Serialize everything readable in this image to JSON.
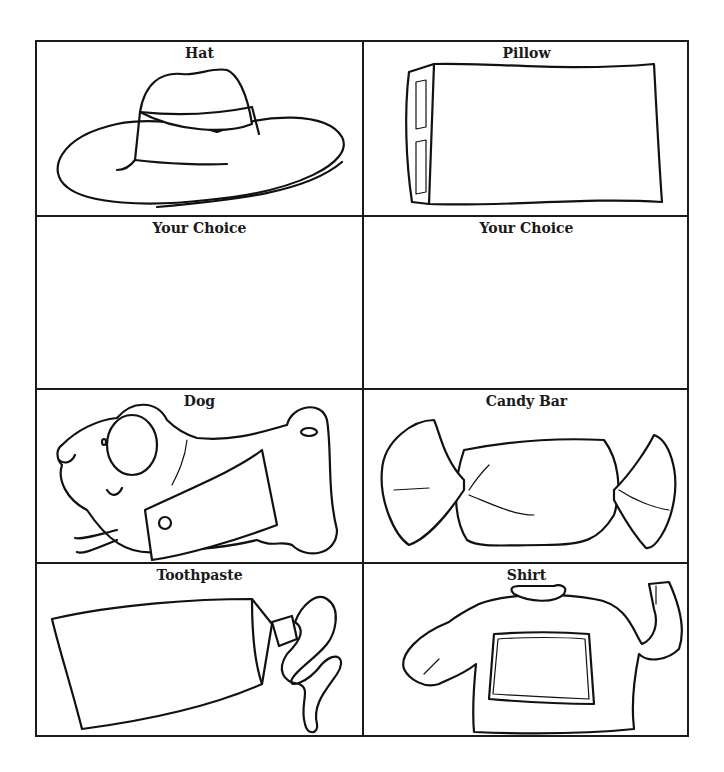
{
  "worksheet": {
    "grid": {
      "rows": 4,
      "columns": 2,
      "line_color": "#1a1a1a"
    },
    "cells": [
      {
        "label": "Hat",
        "icon": "cowboy-hat-icon"
      },
      {
        "label": "Pillow",
        "icon": "pillow-icon"
      },
      {
        "label": "Your Choice",
        "icon": ""
      },
      {
        "label": "Your Choice",
        "icon": ""
      },
      {
        "label": "Dog",
        "icon": "dog-with-coat-icon"
      },
      {
        "label": "Candy Bar",
        "icon": "wrapped-candy-icon"
      },
      {
        "label": "Toothpaste",
        "icon": "toothpaste-tube-icon"
      },
      {
        "label": "Shirt",
        "icon": "sweater-shirt-icon"
      }
    ]
  }
}
